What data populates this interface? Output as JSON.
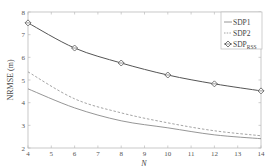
{
  "chart_data": {
    "type": "line",
    "title": "",
    "xlabel": "N",
    "ylabel": "NRMSE (m)",
    "xlim": [
      4,
      14
    ],
    "ylim": [
      2,
      8
    ],
    "xticks": [
      4,
      5,
      6,
      7,
      8,
      9,
      10,
      11,
      12,
      13,
      14
    ],
    "yticks": [
      2,
      3,
      4,
      5,
      6,
      7,
      8
    ],
    "grid": false,
    "legend_position": "upper right",
    "x": [
      4,
      6,
      8,
      10,
      12,
      14
    ],
    "series": [
      {
        "name": "SDP1",
        "label_main": "SDP1",
        "label_sub": "",
        "style": "solid",
        "marker": "none",
        "color": "#8a8a8a",
        "values": [
          4.61,
          3.77,
          3.2,
          2.89,
          2.58,
          2.41
        ]
      },
      {
        "name": "SDP2",
        "label_main": "SDP2",
        "label_sub": "",
        "style": "dashed",
        "marker": "none",
        "color": "#9a9a9a",
        "values": [
          5.36,
          4.17,
          3.55,
          3.11,
          2.76,
          2.54
        ]
      },
      {
        "name": "SDP_RSS",
        "label_main": "SDP",
        "label_sub": "RSS",
        "style": "solid",
        "marker": "diamond",
        "color": "#555555",
        "values": [
          7.52,
          6.41,
          5.75,
          5.22,
          4.83,
          4.52
        ]
      }
    ]
  }
}
